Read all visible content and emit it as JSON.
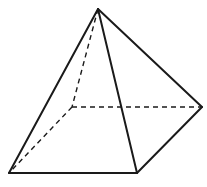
{
  "diagram": {
    "type": "square-pyramid",
    "vertices": {
      "apex": [
        98,
        9
      ],
      "front_left": [
        9,
        173
      ],
      "front_right": [
        137,
        173
      ],
      "back_right": [
        202,
        107
      ],
      "back_left": [
        72,
        107
      ]
    },
    "visible_edges": [
      [
        "apex",
        "front_left"
      ],
      [
        "apex",
        "front_right"
      ],
      [
        "apex",
        "back_right"
      ],
      [
        "front_left",
        "front_right"
      ],
      [
        "front_right",
        "back_right"
      ]
    ],
    "hidden_edges": [
      [
        "apex",
        "back_left"
      ],
      [
        "back_left",
        "front_left"
      ],
      [
        "back_left",
        "back_right"
      ]
    ],
    "colors": {
      "stroke": "#1a1a1a",
      "background": "#ffffff"
    }
  }
}
